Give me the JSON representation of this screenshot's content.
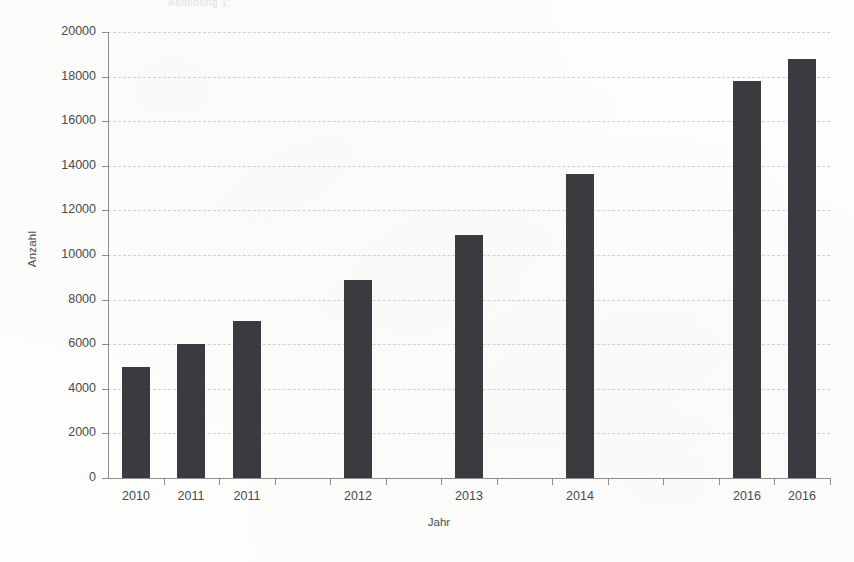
{
  "page": {
    "top_fragment_text": "Abbildung 1:"
  },
  "chart_data": {
    "type": "bar",
    "title": "",
    "subtitle": "",
    "xlabel": "Jahr",
    "ylabel": "Anzahl",
    "categories": [
      "2010",
      "2011",
      "2011",
      "2012",
      "2013",
      "2014",
      "2016",
      "2016"
    ],
    "values": [
      5000,
      6000,
      7050,
      8900,
      10900,
      13650,
      17800,
      18800
    ],
    "slots": [
      0,
      1,
      2,
      4,
      6,
      8,
      11,
      12
    ],
    "slot_count": 13,
    "ylim": [
      0,
      20000
    ],
    "ytick_values": [
      0,
      2000,
      4000,
      6000,
      8000,
      10000,
      12000,
      14000,
      16000,
      18000,
      20000
    ],
    "ytick_labels": [
      "0",
      "2000",
      "4000",
      "6000",
      "8000",
      "10000",
      "12000",
      "14000",
      "16000",
      "18000",
      "20000"
    ],
    "grid": true,
    "grid_axis": "y",
    "legend": false,
    "legend_position": "none",
    "bar_color": "#3b3b3f",
    "grid_color": "#cfcfd4",
    "axis_color": "#8c8c92",
    "text_color": "#4a4a4e"
  }
}
